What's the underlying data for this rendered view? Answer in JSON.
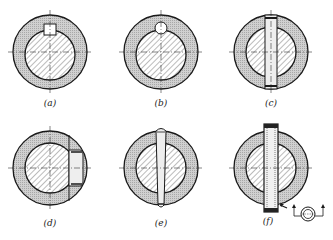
{
  "figure": {
    "panels": [
      {
        "id": "a",
        "label": "(a)",
        "type": "square-key"
      },
      {
        "id": "b",
        "label": "(b)",
        "type": "round-pin-key"
      },
      {
        "id": "c",
        "label": "(c)",
        "type": "transverse-straight-pin"
      },
      {
        "id": "d",
        "label": "(d)",
        "type": "radial-pin-partial"
      },
      {
        "id": "e",
        "label": "(e)",
        "type": "taper-pin"
      },
      {
        "id": "f",
        "label": "(f)",
        "type": "spring-pin",
        "inset": "spring-pin-section-detail"
      }
    ]
  },
  "colors": {
    "hatch": "#555555",
    "ring_fill": "#c8c8c8",
    "line": "#1a1a1a"
  }
}
